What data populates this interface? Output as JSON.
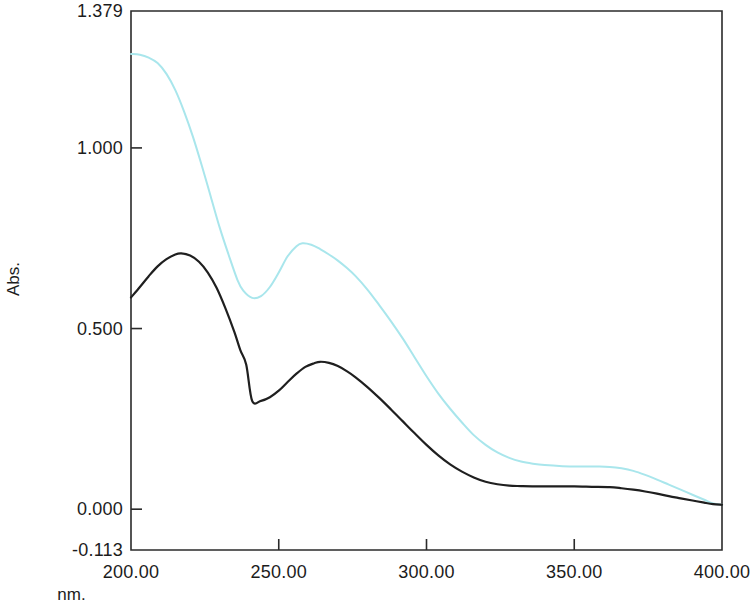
{
  "chart_data": {
    "type": "line",
    "title": "",
    "xlabel": "nm.",
    "ylabel": "Abs.",
    "xlim": [
      200.0,
      400.0
    ],
    "ylim": [
      -0.113,
      1.379
    ],
    "grid": false,
    "legend": "none",
    "x_ticks": [
      200.0,
      250.0,
      300.0,
      350.0,
      400.0
    ],
    "x_tick_labels": [
      "200.00",
      "250.00",
      "300.00",
      "350.00",
      "400.00"
    ],
    "y_ticks": [
      1.379,
      1.0,
      0.5,
      0.0,
      -0.113
    ],
    "y_tick_labels": [
      "1.379",
      "1.000",
      "0.500",
      "0.000",
      "-0.113"
    ],
    "series": [
      {
        "name": "spectrum-cyan",
        "color": "#a9e6ec",
        "x": [
          200,
          203,
          206,
          209,
          212,
          215,
          218,
          221,
          224,
          227,
          230,
          233,
          236,
          238,
          241,
          244,
          247,
          250,
          253,
          256,
          258,
          261,
          264,
          267,
          270,
          273,
          276,
          280,
          284,
          288,
          292,
          296,
          300,
          304,
          308,
          312,
          316,
          320,
          324,
          328,
          332,
          336,
          340,
          346,
          352,
          358,
          362,
          366,
          370,
          374,
          378,
          382,
          386,
          390,
          394,
          397,
          400
        ],
        "y": [
          1.26,
          1.258,
          1.25,
          1.235,
          1.205,
          1.16,
          1.1,
          1.03,
          0.95,
          0.865,
          0.78,
          0.705,
          0.635,
          0.605,
          0.585,
          0.59,
          0.615,
          0.655,
          0.7,
          0.728,
          0.736,
          0.732,
          0.72,
          0.705,
          0.688,
          0.668,
          0.645,
          0.608,
          0.565,
          0.52,
          0.472,
          0.42,
          0.368,
          0.32,
          0.278,
          0.24,
          0.205,
          0.178,
          0.157,
          0.142,
          0.132,
          0.126,
          0.122,
          0.119,
          0.118,
          0.118,
          0.117,
          0.113,
          0.106,
          0.095,
          0.082,
          0.068,
          0.054,
          0.04,
          0.026,
          0.016,
          0.012
        ],
        "width": 2.0
      },
      {
        "name": "spectrum-black",
        "color": "#1f1f1f",
        "x": [
          200,
          203,
          206,
          209,
          212,
          215,
          217,
          220,
          223,
          226,
          229,
          232,
          235,
          237,
          239,
          241,
          244,
          247,
          250,
          253,
          256,
          259,
          262,
          264,
          267,
          270,
          273,
          276,
          280,
          284,
          288,
          292,
          296,
          300,
          304,
          308,
          312,
          316,
          320,
          324,
          328,
          332,
          338,
          344,
          350,
          356,
          362,
          366,
          370,
          374,
          378,
          382,
          386,
          390,
          394,
          397,
          400
        ],
        "y": [
          0.586,
          0.615,
          0.645,
          0.672,
          0.692,
          0.705,
          0.708,
          0.702,
          0.685,
          0.655,
          0.612,
          0.555,
          0.49,
          0.44,
          0.4,
          0.3,
          0.3,
          0.31,
          0.328,
          0.352,
          0.375,
          0.394,
          0.404,
          0.408,
          0.405,
          0.396,
          0.382,
          0.365,
          0.338,
          0.308,
          0.276,
          0.243,
          0.21,
          0.178,
          0.149,
          0.124,
          0.104,
          0.088,
          0.076,
          0.069,
          0.065,
          0.064,
          0.063,
          0.063,
          0.063,
          0.062,
          0.061,
          0.058,
          0.054,
          0.049,
          0.043,
          0.036,
          0.03,
          0.024,
          0.018,
          0.014,
          0.012
        ],
        "width": 2.2
      }
    ]
  },
  "axes": {
    "y_title": "Abs.",
    "x_title": "nm.",
    "y_labels": [
      "1.379",
      "1.000",
      "0.500",
      "0.000",
      "-0.113"
    ],
    "x_labels": [
      "200.00",
      "250.00",
      "300.00",
      "350.00",
      "400.00"
    ]
  },
  "colors": {
    "frame": "#2b2b2b",
    "series_black": "#1f1f1f",
    "series_cyan": "#a9e6ec",
    "background": "#ffffff"
  }
}
